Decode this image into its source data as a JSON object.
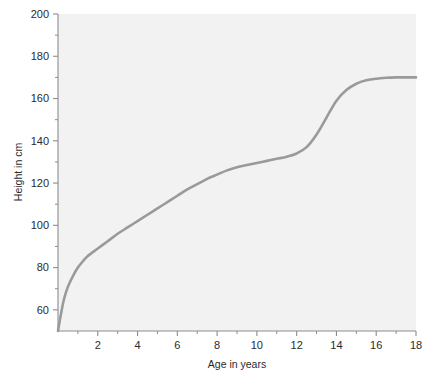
{
  "chart_data": {
    "type": "line",
    "title": "",
    "subtitle": "",
    "xlabel": "Age in years",
    "ylabel": "Height in cm",
    "xlim": [
      0,
      18
    ],
    "ylim": [
      50,
      200
    ],
    "grid": false,
    "legend": null,
    "x_ticks": [
      2,
      4,
      6,
      8,
      10,
      12,
      14,
      16,
      18
    ],
    "x_tick_labels": [
      "2",
      "4",
      "6",
      "8",
      "10",
      "12",
      "14",
      "16",
      "18"
    ],
    "x_minor_ticks": [
      1,
      3,
      5,
      7,
      9,
      11,
      13,
      15,
      17
    ],
    "y_ticks": [
      60,
      80,
      100,
      120,
      140,
      160,
      180,
      200
    ],
    "y_tick_labels": [
      "60",
      "80",
      "100",
      "120",
      "140",
      "160",
      "180",
      "200"
    ],
    "y_minor_ticks": [
      70,
      90,
      110,
      130,
      150,
      170,
      190
    ],
    "series": [
      {
        "name": "Height",
        "color": "#9a9a9a",
        "line_width": 2.6,
        "x": [
          0,
          0.15,
          0.3,
          0.5,
          0.75,
          1,
          1.25,
          1.5,
          2,
          2.5,
          3,
          3.5,
          4,
          4.5,
          5,
          5.5,
          6,
          6.5,
          7,
          7.5,
          8,
          8.5,
          9,
          9.5,
          10,
          10.5,
          11,
          11.5,
          12,
          12.5,
          13,
          13.5,
          14,
          14.5,
          15,
          15.5,
          16,
          16.5,
          17,
          17.5,
          18
        ],
        "y": [
          50,
          58,
          65,
          71,
          76,
          80,
          83,
          85.5,
          89,
          92.5,
          96,
          99,
          102,
          105,
          108,
          111,
          114,
          117,
          119.5,
          122,
          124,
          126,
          127.5,
          128.5,
          129.5,
          130.5,
          131.5,
          132.5,
          134,
          137,
          143,
          151,
          159,
          164,
          167,
          168.6,
          169.4,
          169.8,
          170,
          170,
          170
        ]
      }
    ],
    "annotations": []
  },
  "axes": {
    "y_axis_name": "height-axis",
    "x_axis_name": "age-axis"
  }
}
